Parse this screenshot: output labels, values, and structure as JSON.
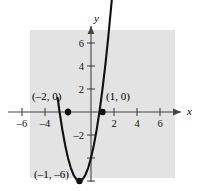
{
  "figure": {
    "background_color": "#ffffff",
    "panel_color": "#e3e3e3",
    "curve_color": "#111111",
    "axis_color": "#444444"
  },
  "axes": {
    "x_name": "x",
    "y_name": "y"
  },
  "x_ticks": [
    {
      "value": -6,
      "label": "–6"
    },
    {
      "value": -4,
      "label": "–4"
    },
    {
      "value": -2,
      "label": ""
    },
    {
      "value": 2,
      "label": "2"
    },
    {
      "value": 4,
      "label": "4"
    },
    {
      "value": 6,
      "label": "6"
    }
  ],
  "y_ticks": [
    {
      "value": 6,
      "label": "6"
    },
    {
      "value": 4,
      "label": "4"
    },
    {
      "value": 2,
      "label": "2"
    },
    {
      "value": -2,
      "label": "–2"
    },
    {
      "value": -4,
      "label": ""
    },
    {
      "value": -6,
      "label": ""
    }
  ],
  "annotations": [
    {
      "name": "left-root-label",
      "text": "(–2, 0)"
    },
    {
      "name": "right-root-label",
      "text": "(1, 0)"
    },
    {
      "name": "vertex-label",
      "text": "(–1, –6)"
    }
  ],
  "chart_data": {
    "type": "line",
    "title": "",
    "xlabel": "x",
    "ylabel": "y",
    "xlim": [
      -7.5,
      7.5
    ],
    "ylim": [
      -7.5,
      7.5
    ],
    "grid": false,
    "legend": "none",
    "curve": {
      "name": "parabola",
      "equation": "y = 2(x + 1)^2 - 6",
      "expanded": "y = 2x^2 + 4x - 4",
      "orientation": "opens-upward",
      "x": [
        -2.9,
        -2.75,
        -2.5,
        -2.25,
        -2.0,
        -1.75,
        -1.5,
        -1.25,
        -1.0,
        -0.75,
        -0.5,
        -0.25,
        0.0,
        0.25,
        0.5,
        0.75,
        1.0,
        1.25,
        1.5,
        1.75,
        1.9
      ],
      "y": [
        1.22,
        0.13,
        -1.5,
        -2.88,
        -4.0,
        -4.88,
        -5.5,
        -5.88,
        -6.0,
        -5.88,
        -5.5,
        -4.88,
        -4.0,
        -2.88,
        -1.5,
        -0.13,
        0.0,
        4.13,
        6.5,
        9.13,
        10.82
      ]
    },
    "points": [
      {
        "label": "(–2, 0)",
        "x": -2,
        "y": 0,
        "marker": "filled-circle"
      },
      {
        "label": "(1, 0)",
        "x": 1,
        "y": 0,
        "marker": "filled-circle"
      },
      {
        "label": "(–1, –6)",
        "x": -1,
        "y": -6,
        "marker": "filled-circle"
      }
    ],
    "x_tick_values": [
      -6,
      -4,
      -2,
      2,
      4,
      6
    ],
    "y_tick_values": [
      6,
      4,
      2,
      -2,
      -4,
      -6
    ],
    "x_tick_labels": [
      "–6",
      "–4",
      "",
      "2",
      "4",
      "6"
    ],
    "y_tick_labels": [
      "6",
      "4",
      "2",
      "–2",
      "",
      ""
    ]
  }
}
